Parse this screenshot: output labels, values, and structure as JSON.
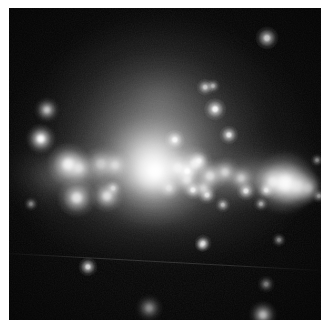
{
  "image": {
    "title": "Irregular starburst galaxy",
    "subject": "galaxy",
    "modality": "optical broadband grayscale astronomical image",
    "width": 329,
    "height": 327,
    "colorspace": "grayscale",
    "border": {
      "color": "#ffffff",
      "left": 9,
      "top": 8,
      "right": 8,
      "bottom": 7
    },
    "background_color": "#050505",
    "peak_color": "#ffffff",
    "orientation_note": "galaxy disk runs roughly east-west across the middle of the frame"
  },
  "chart_data": {
    "type": "scatter",
    "xlabel": "",
    "ylabel": "",
    "xlim": [
      0,
      312
    ],
    "ylim": [
      0,
      312
    ],
    "grid": false,
    "legend": null
  },
  "halo": {
    "label": "diffuse stellar halo",
    "components": [
      {
        "name": "outer-halo",
        "cx": 152,
        "cy": 140,
        "rx": 150,
        "ry": 118,
        "peak": 0.3
      },
      {
        "name": "upper-plume",
        "cx": 150,
        "cy": 92,
        "rx": 104,
        "ry": 86,
        "peak": 0.3
      },
      {
        "name": "mid-halo",
        "cx": 148,
        "cy": 140,
        "rx": 112,
        "ry": 82,
        "peak": 0.38
      },
      {
        "name": "inner-halo",
        "cx": 142,
        "cy": 148,
        "rx": 74,
        "ry": 56,
        "peak": 0.5
      },
      {
        "name": "core-glow",
        "cx": 140,
        "cy": 152,
        "rx": 42,
        "ry": 34,
        "peak": 0.62
      },
      {
        "name": "left-wing",
        "cx": 60,
        "cy": 168,
        "rx": 72,
        "ry": 36,
        "peak": 0.3
      },
      {
        "name": "right-wing",
        "cx": 246,
        "cy": 168,
        "rx": 80,
        "ry": 34,
        "peak": 0.32
      },
      {
        "name": "lower-skirt",
        "cx": 150,
        "cy": 196,
        "rx": 132,
        "ry": 52,
        "peak": 0.22
      }
    ]
  },
  "disk": {
    "label": "star-forming disk",
    "components": [
      {
        "name": "disk-band-left",
        "cx": 72,
        "cy": 166,
        "rx": 66,
        "ry": 17,
        "peak": 0.44
      },
      {
        "name": "disk-band-center",
        "cx": 152,
        "cy": 168,
        "rx": 72,
        "ry": 18,
        "peak": 0.5
      },
      {
        "name": "disk-band-right",
        "cx": 248,
        "cy": 172,
        "rx": 70,
        "ry": 17,
        "peak": 0.48
      }
    ]
  },
  "knots": {
    "label": "HII regions / super star clusters",
    "items": [
      {
        "name": "knot-core",
        "cx": 146,
        "cy": 163,
        "r": 9.0,
        "peak": 1.0
      },
      {
        "name": "knot-core-halo",
        "cx": 144,
        "cy": 164,
        "r": 17.0,
        "peak": 0.6
      },
      {
        "name": "knot-right-major",
        "cx": 276,
        "cy": 175,
        "r": 9.5,
        "peak": 0.98
      },
      {
        "name": "knot-right-b",
        "cx": 288,
        "cy": 178,
        "r": 6.5,
        "peak": 0.8
      },
      {
        "name": "knot-right-c",
        "cx": 264,
        "cy": 174,
        "r": 5.5,
        "peak": 0.76
      },
      {
        "name": "knot-right-d",
        "cx": 299,
        "cy": 180,
        "r": 5.0,
        "peak": 0.66
      },
      {
        "name": "knot-left-a",
        "cx": 59,
        "cy": 156,
        "r": 6.5,
        "peak": 0.92
      },
      {
        "name": "knot-left-b",
        "cx": 70,
        "cy": 160,
        "r": 5.0,
        "peak": 0.7
      },
      {
        "name": "knot-left-c",
        "cx": 92,
        "cy": 156,
        "r": 5.5,
        "peak": 0.62
      },
      {
        "name": "knot-left-d",
        "cx": 106,
        "cy": 157,
        "r": 4.5,
        "peak": 0.66
      },
      {
        "name": "knot-left-e",
        "cx": 68,
        "cy": 190,
        "r": 6.0,
        "peak": 0.86
      },
      {
        "name": "knot-left-f",
        "cx": 98,
        "cy": 188,
        "r": 5.0,
        "peak": 0.82
      },
      {
        "name": "knot-mid-a",
        "cx": 169,
        "cy": 160,
        "r": 5.5,
        "peak": 0.8
      },
      {
        "name": "knot-mid-b",
        "cx": 186,
        "cy": 156,
        "r": 5.5,
        "peak": 0.84
      },
      {
        "name": "knot-mid-c",
        "cx": 178,
        "cy": 172,
        "r": 4.5,
        "peak": 0.74
      },
      {
        "name": "knot-mid-d",
        "cx": 201,
        "cy": 168,
        "r": 5.0,
        "peak": 0.78
      },
      {
        "name": "knot-mid-e",
        "cx": 216,
        "cy": 164,
        "r": 4.5,
        "peak": 0.72
      },
      {
        "name": "knot-mid-f",
        "cx": 232,
        "cy": 170,
        "r": 4.0,
        "peak": 0.68
      },
      {
        "name": "knot-mid-g",
        "cx": 194,
        "cy": 180,
        "r": 4.0,
        "peak": 0.7
      },
      {
        "name": "knot-mid-h",
        "cx": 160,
        "cy": 180,
        "r": 3.6,
        "peak": 0.62
      }
    ]
  },
  "stars": {
    "label": "foreground and resolved point sources",
    "items": [
      {
        "name": "star-ul-bright",
        "cx": 32,
        "cy": 131,
        "r": 4.6,
        "peak": 1.0
      },
      {
        "name": "star-ul-dim",
        "cx": 38,
        "cy": 102,
        "r": 3.8,
        "peak": 0.76
      },
      {
        "name": "star-ur-bright",
        "cx": 258,
        "cy": 30,
        "r": 3.6,
        "peak": 0.92
      },
      {
        "name": "star-top-a",
        "cx": 196,
        "cy": 79,
        "r": 2.6,
        "peak": 0.72
      },
      {
        "name": "star-top-b",
        "cx": 204,
        "cy": 78,
        "r": 2.2,
        "peak": 0.6
      },
      {
        "name": "star-top-c",
        "cx": 206,
        "cy": 101,
        "r": 3.4,
        "peak": 0.94
      },
      {
        "name": "star-mid-a",
        "cx": 166,
        "cy": 132,
        "r": 3.2,
        "peak": 0.92
      },
      {
        "name": "star-mid-b",
        "cx": 220,
        "cy": 127,
        "r": 3.0,
        "peak": 0.86
      },
      {
        "name": "star-mid-c",
        "cx": 178,
        "cy": 163,
        "r": 3.4,
        "peak": 0.96
      },
      {
        "name": "star-mid-d",
        "cx": 190,
        "cy": 153,
        "r": 3.0,
        "peak": 0.82
      },
      {
        "name": "star-mid-e",
        "cx": 104,
        "cy": 180,
        "r": 2.6,
        "peak": 0.66
      },
      {
        "name": "star-mid-f",
        "cx": 184,
        "cy": 182,
        "r": 3.0,
        "peak": 0.86
      },
      {
        "name": "star-mid-g",
        "cx": 198,
        "cy": 187,
        "r": 2.8,
        "peak": 0.8
      },
      {
        "name": "star-mid-h",
        "cx": 237,
        "cy": 183,
        "r": 3.0,
        "peak": 0.84
      },
      {
        "name": "star-mid-i",
        "cx": 257,
        "cy": 182,
        "r": 2.6,
        "peak": 0.76
      },
      {
        "name": "star-mid-j",
        "cx": 214,
        "cy": 197,
        "r": 2.4,
        "peak": 0.66
      },
      {
        "name": "star-mid-k",
        "cx": 252,
        "cy": 196,
        "r": 2.2,
        "peak": 0.6
      },
      {
        "name": "star-mid-l",
        "cx": 310,
        "cy": 188,
        "r": 2.2,
        "peak": 0.62
      },
      {
        "name": "star-low-a",
        "cx": 194,
        "cy": 235,
        "r": 2.6,
        "peak": 0.72
      },
      {
        "name": "star-low-b",
        "cx": 193,
        "cy": 237,
        "r": 2.2,
        "peak": 0.6
      },
      {
        "name": "star-low-c",
        "cx": 270,
        "cy": 232,
        "r": 2.2,
        "peak": 0.52
      },
      {
        "name": "star-low-d",
        "cx": 79,
        "cy": 259,
        "r": 3.0,
        "peak": 0.82
      },
      {
        "name": "star-low-e",
        "cx": 257,
        "cy": 276,
        "r": 2.6,
        "peak": 0.52
      },
      {
        "name": "star-low-f",
        "cx": 140,
        "cy": 300,
        "r": 4.0,
        "peak": 0.56
      },
      {
        "name": "star-low-g",
        "cx": 254,
        "cy": 307,
        "r": 4.2,
        "peak": 0.94
      },
      {
        "name": "star-edge-right",
        "cx": 308,
        "cy": 152,
        "r": 2.0,
        "peak": 0.56
      },
      {
        "name": "star-left-edge",
        "cx": 22,
        "cy": 196,
        "r": 2.2,
        "peak": 0.5
      }
    ]
  },
  "artifacts": {
    "label": "detector artifacts",
    "items": [
      {
        "name": "satellite-trail",
        "description": "faint straight diagonal streak across the lower third",
        "x1": 0,
        "y1": 245,
        "x2": 312,
        "y2": 262,
        "peak": 0.2
      }
    ]
  }
}
